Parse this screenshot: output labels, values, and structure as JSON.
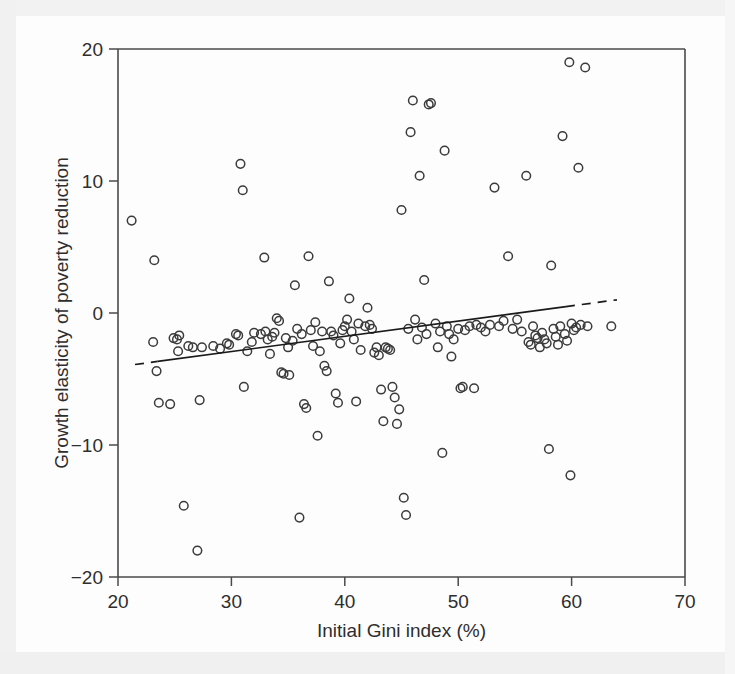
{
  "chart_data": {
    "type": "scatter",
    "title": "",
    "xlabel": "Initial Gini index (%)",
    "ylabel": "Growth elasticity of poverty reduction",
    "xlim": [
      20,
      70
    ],
    "ylim": [
      -20,
      20
    ],
    "xticks": [
      20,
      30,
      40,
      50,
      60,
      70
    ],
    "yticks": [
      20,
      10,
      0,
      -10,
      -20
    ],
    "xtick_labels": [
      "20",
      "30",
      "40",
      "50",
      "60",
      "70"
    ],
    "ytick_labels": [
      "20",
      "10",
      "0",
      "−10",
      "−20"
    ],
    "grid": false,
    "legend": null,
    "marker": "open-circle",
    "marker_color": "#3b3b3b",
    "series": [
      {
        "name": "Countries",
        "points": [
          [
            21.2,
            7.0
          ],
          [
            23.2,
            4.0
          ],
          [
            23.1,
            -2.2
          ],
          [
            23.4,
            -4.4
          ],
          [
            23.6,
            -6.8
          ],
          [
            24.6,
            -6.9
          ],
          [
            24.9,
            -1.9
          ],
          [
            25.2,
            -2.0
          ],
          [
            25.3,
            -2.9
          ],
          [
            25.4,
            -1.7
          ],
          [
            25.8,
            -14.6
          ],
          [
            26.2,
            -2.5
          ],
          [
            26.6,
            -2.6
          ],
          [
            27.0,
            -18.0
          ],
          [
            27.2,
            -6.6
          ],
          [
            27.4,
            -2.6
          ],
          [
            28.4,
            -2.5
          ],
          [
            29.0,
            -2.7
          ],
          [
            29.6,
            -2.3
          ],
          [
            29.8,
            -2.4
          ],
          [
            30.4,
            -1.6
          ],
          [
            30.6,
            -1.7
          ],
          [
            30.8,
            11.3
          ],
          [
            31.0,
            9.3
          ],
          [
            31.1,
            -5.6
          ],
          [
            31.4,
            -2.9
          ],
          [
            31.8,
            -2.2
          ],
          [
            32.0,
            -1.5
          ],
          [
            32.6,
            -1.6
          ],
          [
            32.9,
            4.2
          ],
          [
            33.0,
            -1.4
          ],
          [
            33.2,
            -2.0
          ],
          [
            33.4,
            -3.1
          ],
          [
            33.6,
            -1.8
          ],
          [
            33.8,
            -1.5
          ],
          [
            34.0,
            -0.4
          ],
          [
            34.2,
            -0.6
          ],
          [
            34.4,
            -4.5
          ],
          [
            34.6,
            -4.6
          ],
          [
            34.8,
            -1.9
          ],
          [
            35.0,
            -2.6
          ],
          [
            35.1,
            -4.7
          ],
          [
            35.4,
            -2.1
          ],
          [
            35.6,
            2.1
          ],
          [
            35.8,
            -1.2
          ],
          [
            36.0,
            -15.5
          ],
          [
            36.2,
            -1.6
          ],
          [
            36.4,
            -6.9
          ],
          [
            36.6,
            -7.2
          ],
          [
            36.8,
            4.3
          ],
          [
            37.0,
            -1.3
          ],
          [
            37.2,
            -2.5
          ],
          [
            37.4,
            -0.7
          ],
          [
            37.6,
            -9.3
          ],
          [
            37.8,
            -2.9
          ],
          [
            38.0,
            -1.4
          ],
          [
            38.2,
            -4.0
          ],
          [
            38.4,
            -4.4
          ],
          [
            38.6,
            2.4
          ],
          [
            38.8,
            -1.4
          ],
          [
            39.0,
            -1.7
          ],
          [
            39.2,
            -6.1
          ],
          [
            39.4,
            -6.8
          ],
          [
            39.6,
            -2.3
          ],
          [
            39.8,
            -1.3
          ],
          [
            40.0,
            -1.0
          ],
          [
            40.2,
            -0.5
          ],
          [
            40.4,
            1.1
          ],
          [
            40.6,
            -1.4
          ],
          [
            40.8,
            -2.0
          ],
          [
            41.0,
            -6.7
          ],
          [
            41.2,
            -0.8
          ],
          [
            41.4,
            -2.8
          ],
          [
            41.8,
            -1.0
          ],
          [
            42.0,
            0.4
          ],
          [
            42.2,
            -0.9
          ],
          [
            42.4,
            -1.2
          ],
          [
            42.6,
            -3.0
          ],
          [
            42.8,
            -2.6
          ],
          [
            43.0,
            -3.2
          ],
          [
            43.2,
            -5.8
          ],
          [
            43.4,
            -8.2
          ],
          [
            43.6,
            -2.6
          ],
          [
            43.8,
            -2.7
          ],
          [
            44.0,
            -2.8
          ],
          [
            44.2,
            -5.6
          ],
          [
            44.4,
            -6.4
          ],
          [
            44.6,
            -8.4
          ],
          [
            44.8,
            -7.3
          ],
          [
            45.0,
            7.8
          ],
          [
            45.2,
            -14.0
          ],
          [
            45.4,
            -15.3
          ],
          [
            45.6,
            -1.2
          ],
          [
            45.8,
            13.7
          ],
          [
            46.0,
            16.1
          ],
          [
            46.2,
            -0.5
          ],
          [
            46.4,
            -2.0
          ],
          [
            46.6,
            10.4
          ],
          [
            46.8,
            -1.1
          ],
          [
            47.0,
            2.5
          ],
          [
            47.2,
            -1.6
          ],
          [
            47.4,
            15.8
          ],
          [
            47.6,
            15.9
          ],
          [
            48.0,
            -0.8
          ],
          [
            48.2,
            -2.6
          ],
          [
            48.4,
            -1.4
          ],
          [
            48.6,
            -10.6
          ],
          [
            48.8,
            12.3
          ],
          [
            49.0,
            -1.0
          ],
          [
            49.2,
            -1.6
          ],
          [
            49.4,
            -3.3
          ],
          [
            49.6,
            -2.0
          ],
          [
            50.0,
            -1.2
          ],
          [
            50.2,
            -5.7
          ],
          [
            50.4,
            -5.6
          ],
          [
            50.6,
            -1.3
          ],
          [
            51.0,
            -1.0
          ],
          [
            51.4,
            -5.7
          ],
          [
            51.6,
            -0.9
          ],
          [
            52.0,
            -1.1
          ],
          [
            52.4,
            -1.4
          ],
          [
            52.8,
            -0.9
          ],
          [
            53.2,
            9.5
          ],
          [
            53.6,
            -1.0
          ],
          [
            54.0,
            -0.6
          ],
          [
            54.4,
            4.3
          ],
          [
            54.8,
            -1.2
          ],
          [
            55.2,
            -0.5
          ],
          [
            55.6,
            -1.4
          ],
          [
            56.0,
            10.4
          ],
          [
            56.2,
            -2.2
          ],
          [
            56.4,
            -2.4
          ],
          [
            56.6,
            -1.0
          ],
          [
            56.8,
            -1.7
          ],
          [
            57.0,
            -1.9
          ],
          [
            57.2,
            -2.6
          ],
          [
            57.4,
            -1.5
          ],
          [
            57.6,
            -2.0
          ],
          [
            57.8,
            -2.3
          ],
          [
            58.0,
            -10.3
          ],
          [
            58.2,
            3.6
          ],
          [
            58.4,
            -1.2
          ],
          [
            58.6,
            -1.8
          ],
          [
            58.8,
            -2.4
          ],
          [
            59.0,
            -1.0
          ],
          [
            59.2,
            13.4
          ],
          [
            59.4,
            -1.6
          ],
          [
            59.6,
            -2.1
          ],
          [
            59.8,
            19.0
          ],
          [
            59.9,
            -12.3
          ],
          [
            60.0,
            -0.8
          ],
          [
            60.2,
            -1.3
          ],
          [
            60.4,
            -1.1
          ],
          [
            60.6,
            11.0
          ],
          [
            60.8,
            -0.9
          ],
          [
            61.2,
            18.6
          ],
          [
            61.4,
            -1.0
          ],
          [
            63.5,
            -1.0
          ]
        ]
      }
    ],
    "trendline": {
      "name": "fitted regression line",
      "style": "solid with dashed extensions",
      "x_start": 21.5,
      "y_start": -3.9,
      "x_end": 64.0,
      "y_end": 1.0,
      "solid_x_start": 23.5,
      "solid_x_end": 59.5
    }
  }
}
